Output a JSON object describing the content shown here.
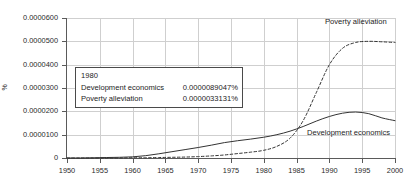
{
  "chart_data": {
    "type": "line",
    "title": "",
    "xlabel": "",
    "ylabel": "%",
    "xlim": [
      1950,
      2000
    ],
    "ylim": [
      0,
      6e-05
    ],
    "grid": true,
    "legend_position": "inline-annotations",
    "x_ticks": [
      "1950",
      "1955",
      "1960",
      "1965",
      "1970",
      "1975",
      "1980",
      "1985",
      "1990",
      "1995",
      "2000"
    ],
    "y_ticks": [
      "0",
      "0.0000100",
      "0.0000200",
      "0.0000300",
      "0.0000400",
      "0.0000500",
      "0.0000600"
    ],
    "x": [
      1950,
      1952,
      1954,
      1956,
      1958,
      1960,
      1962,
      1964,
      1966,
      1968,
      1970,
      1972,
      1974,
      1976,
      1978,
      1980,
      1982,
      1984,
      1986,
      1988,
      1990,
      1992,
      1994,
      1996,
      1998,
      2000
    ],
    "series": [
      {
        "name": "Development economics",
        "style": "solid",
        "color": "#333333",
        "values": [
          0.0,
          0.0,
          1e-07,
          2e-07,
          3e-07,
          5e-07,
          1e-06,
          1.8e-06,
          2.7e-06,
          3.6e-06,
          4.5e-06,
          5.5e-06,
          6.6e-06,
          7.4e-06,
          8.1e-06,
          8.9e-06,
          1e-05,
          1.15e-05,
          1.35e-05,
          1.58e-05,
          1.78e-05,
          1.92e-05,
          1.97e-05,
          1.9e-05,
          1.72e-05,
          1.6e-05
        ]
      },
      {
        "name": "Poverty alleviation",
        "style": "dashed",
        "color": "#333333",
        "values": [
          0.0,
          0.0,
          0.0,
          0.0,
          0.0,
          1e-07,
          1e-07,
          2e-07,
          3e-07,
          4e-07,
          6e-07,
          9e-07,
          1.3e-06,
          1.9e-06,
          2.5e-06,
          3.3e-06,
          5e-06,
          8.5e-06,
          1.6e-05,
          2.8e-05,
          4e-05,
          4.7e-05,
          4.95e-05,
          5e-05,
          4.98e-05,
          4.95e-05
        ]
      }
    ],
    "annotations": [
      {
        "name": "Poverty alleviation",
        "x": 1995,
        "y": 5.55e-05
      },
      {
        "name": "Development economics",
        "x": 1992,
        "y": 1.22e-05
      }
    ]
  },
  "tooltip": {
    "year": "1980",
    "rows": [
      {
        "label": "Development economics",
        "value": "0.0000089047%"
      },
      {
        "label": "Poverty alleviation",
        "value": "0.0000033131%"
      }
    ]
  }
}
